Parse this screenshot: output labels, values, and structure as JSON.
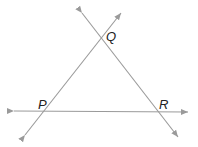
{
  "diagram": {
    "type": "geometry",
    "line_color": "#9a9a9a",
    "points": [
      {
        "label": "Q",
        "x": 102,
        "y": 38
      },
      {
        "label": "P",
        "x": 45,
        "y": 111
      },
      {
        "label": "R",
        "x": 158,
        "y": 112
      }
    ],
    "lines": [
      {
        "name": "line-PQ",
        "from": [
          25,
          135
        ],
        "to": [
          121,
          13
        ]
      },
      {
        "name": "line-QR",
        "from": [
          82,
          13
        ],
        "to": [
          178,
          137
        ]
      },
      {
        "name": "line-PR",
        "from": [
          14,
          111
        ],
        "to": [
          188,
          112
        ]
      }
    ],
    "labels": {
      "Q": "Q",
      "P": "P",
      "R": "R"
    }
  }
}
